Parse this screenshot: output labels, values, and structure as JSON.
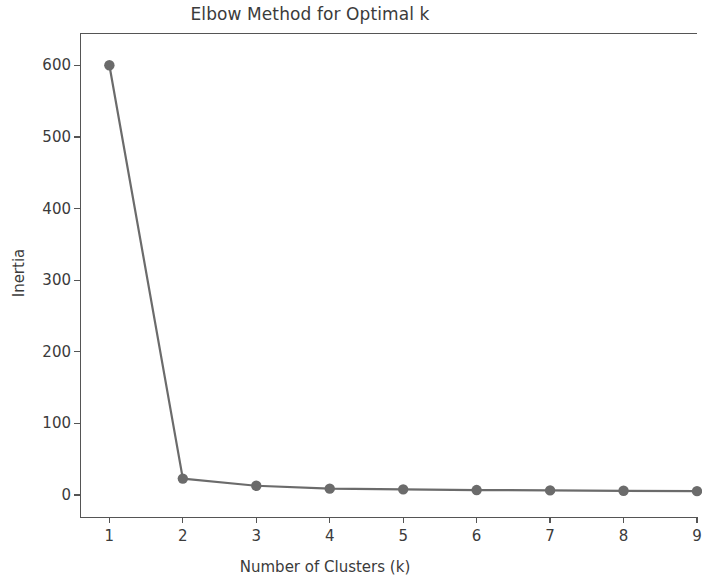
{
  "chart_data": {
    "type": "line",
    "title": "Elbow Method for Optimal k",
    "xlabel": "Number of Clusters (k)",
    "ylabel": "Inertia",
    "x": [
      1,
      2,
      3,
      4,
      5,
      6,
      7,
      8,
      9
    ],
    "values": [
      600,
      23,
      13,
      9,
      8,
      7,
      6.5,
      6,
      5.5
    ],
    "series": [
      {
        "name": "Inertia",
        "values": [
          600,
          23,
          13,
          9,
          8,
          7,
          6.5,
          6,
          5.5
        ]
      }
    ],
    "xlim": [
      0.6,
      9.0
    ],
    "ylim": [
      -32,
      645
    ],
    "xticks": [
      1,
      2,
      3,
      4,
      5,
      6,
      7,
      8,
      9
    ],
    "xtick_labels": [
      "1",
      "2",
      "3",
      "4",
      "5",
      "6",
      "7",
      "8",
      "9"
    ],
    "yticks": [
      0,
      100,
      200,
      300,
      400,
      500,
      600
    ],
    "ytick_labels": [
      "0",
      "100",
      "200",
      "300",
      "400",
      "500",
      "600"
    ],
    "grid": false,
    "legend": null,
    "marker": "circle",
    "line_color": "#6b6b6b",
    "marker_color": "#6b6b6b",
    "text_color": "#3b3b3b",
    "spine_color": "#555555",
    "background": "#ffffff"
  }
}
